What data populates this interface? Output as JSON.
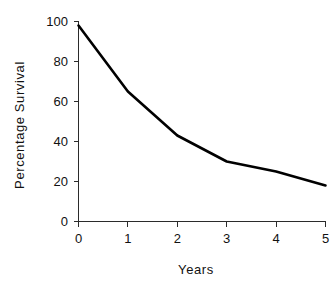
{
  "chart_data": {
    "type": "line",
    "title": "",
    "xlabel": "Years",
    "ylabel": "Percentage Survival",
    "x": [
      0,
      1,
      2,
      3,
      4,
      5
    ],
    "values": [
      98,
      65,
      43,
      30,
      25,
      18
    ],
    "series": [
      {
        "name": "Percentage Survival",
        "values": [
          98,
          65,
          43,
          30,
          25,
          18
        ]
      }
    ],
    "xlim": [
      0,
      5
    ],
    "ylim": [
      0,
      100
    ],
    "xticks": [
      0,
      1,
      2,
      3,
      4,
      5
    ],
    "yticks": [
      0,
      20,
      40,
      60,
      80,
      100
    ],
    "xtick_labels": [
      "0",
      "1",
      "2",
      "3",
      "4",
      "5"
    ],
    "ytick_labels": [
      "0",
      "20",
      "40",
      "60",
      "80",
      "100"
    ],
    "grid": false,
    "legend": false,
    "legend_position": "none",
    "line_color": "#000000",
    "axis_color": "#2b2b2b",
    "background_color": "#ffffff",
    "annotations": []
  },
  "axes": {
    "y_title": "Percentage Survival",
    "x_title": "Years"
  },
  "ticks": {
    "y": [
      "100",
      "80",
      "60",
      "40",
      "20",
      "0"
    ],
    "x": [
      "0",
      "1",
      "2",
      "3",
      "4",
      "5"
    ]
  }
}
